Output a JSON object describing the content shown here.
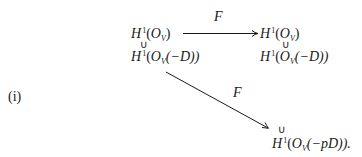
{
  "equation_label": "(i)",
  "arrow_labels": {
    "top": "F",
    "diagonal": "F"
  },
  "nodes": {
    "top_left": {
      "H": "H",
      "sup": "1",
      "paren_open": "(",
      "O": "O",
      "sub": "V",
      "paren_close": ")"
    },
    "top_right": {
      "H": "H",
      "sup": "1",
      "paren_open": "(",
      "O": "O",
      "sub": "V",
      "paren_close": ")"
    },
    "mid_left": {
      "H": "H",
      "sup": "1",
      "paren_open": "(",
      "O": "O",
      "sub": "V",
      "inner": "(−D))"
    },
    "mid_right": {
      "H": "H",
      "sup": "1",
      "paren_open": "(",
      "O": "O",
      "sub": "V",
      "inner": "(−D))"
    },
    "bottom": {
      "H": "H",
      "sup": "1",
      "paren_open": "(",
      "O": "O",
      "sub": "V",
      "inner": "(−pD))."
    }
  },
  "inclusion_symbol": "∪",
  "colors": {
    "ink": "#1a1a1a",
    "background": "#ffffff"
  }
}
